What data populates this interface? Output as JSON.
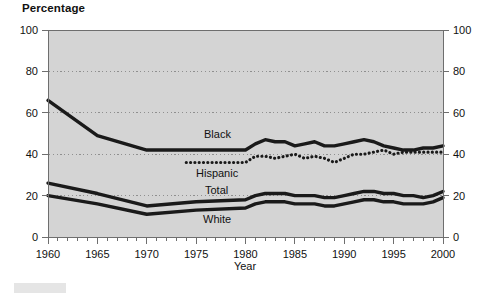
{
  "title": "Percentage",
  "axes": {
    "x_title": "Year",
    "y_ticks": [
      "0",
      "20",
      "40",
      "60",
      "80",
      "100"
    ],
    "x_ticks": [
      "1960",
      "1965",
      "1970",
      "1975",
      "1980",
      "1985",
      "1990",
      "1995",
      "2000"
    ]
  },
  "series_labels": {
    "black": "Black",
    "hispanic": "Hispanic",
    "total": "Total",
    "white": "White"
  },
  "colors": {
    "plot_background": "#d4d4d4",
    "line": "#1a1a1a",
    "gridline": "#8f8f8f",
    "axis": "#6e6e6e",
    "text": "#111111"
  },
  "chart_data": {
    "type": "line",
    "title": "Percentage",
    "xlabel": "Year",
    "ylabel": "Percentage",
    "xlim": [
      1960,
      2000
    ],
    "ylim": [
      0,
      100
    ],
    "yticks": [
      0,
      20,
      40,
      60,
      80,
      100
    ],
    "xticks": [
      1960,
      1965,
      1970,
      1975,
      1980,
      1985,
      1990,
      1995,
      2000
    ],
    "grid": "horizontal-dotted",
    "legend": "inline-labels",
    "x_minor_tick_interval": 1,
    "series": [
      {
        "name": "Black",
        "style": "solid-thick",
        "x": [
          1960,
          1965,
          1970,
          1975,
          1980,
          1981,
          1982,
          1983,
          1984,
          1985,
          1986,
          1987,
          1988,
          1989,
          1990,
          1991,
          1992,
          1993,
          1994,
          1995,
          1996,
          1997,
          1998,
          1999,
          2000
        ],
        "values": [
          66,
          49,
          42,
          42,
          42,
          45,
          47,
          46,
          46,
          44,
          45,
          46,
          44,
          44,
          45,
          46,
          47,
          46,
          44,
          43,
          42,
          42,
          43,
          43,
          44
        ]
      },
      {
        "name": "Hispanic",
        "style": "dotted",
        "x": [
          1974,
          1975,
          1976,
          1977,
          1978,
          1979,
          1980,
          1981,
          1982,
          1983,
          1984,
          1985,
          1986,
          1987,
          1988,
          1989,
          1990,
          1991,
          1992,
          1993,
          1994,
          1995,
          1996,
          1997,
          1998,
          1999,
          2000
        ],
        "values": [
          36,
          36,
          36,
          36,
          36,
          36,
          36,
          39,
          39,
          38,
          39,
          40,
          38,
          39,
          38,
          36,
          38,
          40,
          40,
          41,
          42,
          40,
          41,
          41,
          41,
          41,
          41
        ]
      },
      {
        "name": "Total",
        "style": "solid-thick",
        "x": [
          1960,
          1965,
          1970,
          1975,
          1980,
          1981,
          1982,
          1983,
          1984,
          1985,
          1986,
          1987,
          1988,
          1989,
          1990,
          1991,
          1992,
          1993,
          1994,
          1995,
          1996,
          1997,
          1998,
          1999,
          2000
        ],
        "values": [
          26,
          21,
          15,
          17,
          18,
          20,
          21,
          21,
          21,
          20,
          20,
          20,
          19,
          19,
          20,
          21,
          22,
          22,
          21,
          21,
          20,
          20,
          19,
          20,
          22
        ]
      },
      {
        "name": "White",
        "style": "solid-thick",
        "x": [
          1960,
          1965,
          1970,
          1975,
          1980,
          1981,
          1982,
          1983,
          1984,
          1985,
          1986,
          1987,
          1988,
          1989,
          1990,
          1991,
          1992,
          1993,
          1994,
          1995,
          1996,
          1997,
          1998,
          1999,
          2000
        ],
        "values": [
          20,
          16,
          11,
          13,
          14,
          16,
          17,
          17,
          17,
          16,
          16,
          16,
          15,
          15,
          16,
          17,
          18,
          18,
          17,
          17,
          16,
          16,
          16,
          17,
          19
        ]
      }
    ]
  }
}
